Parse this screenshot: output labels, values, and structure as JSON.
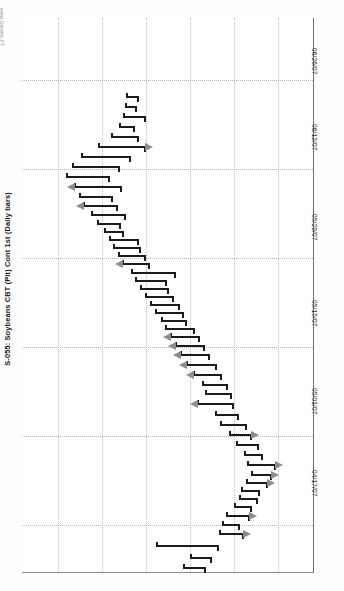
{
  "watermark": "www.Generic.FT",
  "title": "S-055: Soybeans CBT (Pit) Cont 1st (Daily bars)",
  "annotation": "16 h/l",
  "chart_data": {
    "type": "bar",
    "chart_style": "ohlc-daily-bars-rotated-90",
    "title": "S-055: Soybeans CBT (Pit) Cont 1st (Daily bars)",
    "xlabel": "Date",
    "ylabel": "Price (cents/bu)",
    "grid": true,
    "legend": null,
    "annotations": [
      "16 h/l"
    ],
    "axis_dates": [
      "06/26/07",
      "06/12/07",
      "05/29/07",
      "05/15/07",
      "05/01/07",
      "04/17/07"
    ],
    "date_tick_y": [
      52,
      128,
      218,
      302,
      392,
      472
    ],
    "price_gridlines_x": [
      36,
      80,
      124,
      168,
      212,
      256
    ],
    "date_gridlines_y": [
      62,
      151,
      240,
      329,
      418,
      507
    ],
    "ylim": [
      640,
      920
    ],
    "series": [
      {
        "name": "Soybeans CBT Pit Cont 1st",
        "ohlc": [
          {
            "date": "04/16/07",
            "low": 709,
            "high": 713,
            "open": 711,
            "close": 710,
            "arrow": null
          },
          {
            "date": "04/17/07",
            "low": 707,
            "high": 714,
            "open": 708,
            "close": 713,
            "arrow": null
          },
          {
            "date": "04/18/07",
            "low": 712,
            "high": 741,
            "open": 713,
            "close": 740,
            "arrow": null
          },
          {
            "date": "04/19/07",
            "low": 737,
            "high": 755,
            "open": 738,
            "close": 754,
            "arrow": "right"
          },
          {
            "date": "04/20/07",
            "low": 739,
            "high": 750,
            "open": 741,
            "close": 748,
            "arrow": null
          },
          {
            "date": "04/23/07",
            "low": 745,
            "high": 759,
            "open": 747,
            "close": 757,
            "arrow": "right"
          },
          {
            "date": "04/24/07",
            "low": 751,
            "high": 761,
            "open": 753,
            "close": 760,
            "arrow": null
          },
          {
            "date": "04/25/07",
            "low": 754,
            "high": 765,
            "open": 756,
            "close": 763,
            "arrow": null
          },
          {
            "date": "04/26/07",
            "low": 757,
            "high": 766,
            "open": 758,
            "close": 765,
            "arrow": null
          },
          {
            "date": "04/27/07",
            "low": 761,
            "high": 773,
            "open": 763,
            "close": 771,
            "arrow": "right"
          },
          {
            "date": "04/30/07",
            "low": 765,
            "high": 776,
            "open": 767,
            "close": 774,
            "arrow": "right"
          },
          {
            "date": "05/01/07",
            "low": 762,
            "high": 779,
            "open": 764,
            "close": 777,
            "arrow": "right"
          },
          {
            "date": "05/02/07",
            "low": 760,
            "high": 769,
            "open": 762,
            "close": 767,
            "arrow": null
          },
          {
            "date": "05/03/07",
            "low": 755,
            "high": 766,
            "open": 757,
            "close": 764,
            "arrow": null
          },
          {
            "date": "05/04/07",
            "low": 750,
            "high": 761,
            "open": 752,
            "close": 759,
            "arrow": "right"
          },
          {
            "date": "05/07/07",
            "low": 744,
            "high": 757,
            "open": 746,
            "close": 755,
            "arrow": null
          },
          {
            "date": "05/08/07",
            "low": 741,
            "high": 752,
            "open": 743,
            "close": 750,
            "arrow": null
          },
          {
            "date": "05/09/07",
            "low": 730,
            "high": 748,
            "open": 732,
            "close": 746,
            "arrow": "left"
          },
          {
            "date": "05/10/07",
            "low": 735,
            "high": 747,
            "open": 737,
            "close": 745,
            "arrow": null
          },
          {
            "date": "05/11/07",
            "low": 733,
            "high": 744,
            "open": 735,
            "close": 742,
            "arrow": null
          },
          {
            "date": "05/14/07",
            "low": 728,
            "high": 740,
            "open": 730,
            "close": 738,
            "arrow": "left"
          },
          {
            "date": "05/15/07",
            "low": 724,
            "high": 737,
            "open": 726,
            "close": 735,
            "arrow": "left"
          },
          {
            "date": "05/16/07",
            "low": 720,
            "high": 733,
            "open": 722,
            "close": 731,
            "arrow": "left"
          },
          {
            "date": "05/17/07",
            "low": 718,
            "high": 730,
            "open": 720,
            "close": 728,
            "arrow": "left"
          },
          {
            "date": "05/18/07",
            "low": 715,
            "high": 727,
            "open": 717,
            "close": 725,
            "arrow": "left"
          },
          {
            "date": "05/21/07",
            "low": 712,
            "high": 724,
            "open": 714,
            "close": 722,
            "arrow": null
          },
          {
            "date": "05/22/07",
            "low": 710,
            "high": 720,
            "open": 712,
            "close": 718,
            "arrow": null
          },
          {
            "date": "05/23/07",
            "low": 706,
            "high": 718,
            "open": 708,
            "close": 716,
            "arrow": null
          },
          {
            "date": "05/24/07",
            "low": 703,
            "high": 716,
            "open": 705,
            "close": 714,
            "arrow": null
          },
          {
            "date": "05/25/07",
            "low": 700,
            "high": 712,
            "open": 702,
            "close": 710,
            "arrow": null
          },
          {
            "date": "05/29/07",
            "low": 697,
            "high": 710,
            "open": 699,
            "close": 708,
            "arrow": null
          },
          {
            "date": "05/30/07",
            "low": 694,
            "high": 709,
            "open": 696,
            "close": 707,
            "arrow": null
          },
          {
            "date": "05/31/07",
            "low": 692,
            "high": 714,
            "open": 694,
            "close": 712,
            "arrow": null
          },
          {
            "date": "06/01/07",
            "low": 688,
            "high": 701,
            "open": 690,
            "close": 699,
            "arrow": "left"
          },
          {
            "date": "06/04/07",
            "low": 686,
            "high": 699,
            "open": 688,
            "close": 697,
            "arrow": null
          },
          {
            "date": "06/05/07",
            "low": 683,
            "high": 696,
            "open": 685,
            "close": 694,
            "arrow": null
          },
          {
            "date": "06/06/07",
            "low": 681,
            "high": 695,
            "open": 683,
            "close": 693,
            "arrow": null
          },
          {
            "date": "06/07/07",
            "low": 678,
            "high": 689,
            "open": 680,
            "close": 687,
            "arrow": null
          },
          {
            "date": "06/08/07",
            "low": 674,
            "high": 687,
            "open": 676,
            "close": 685,
            "arrow": null
          },
          {
            "date": "06/11/07",
            "low": 670,
            "high": 689,
            "open": 672,
            "close": 687,
            "arrow": null
          },
          {
            "date": "06/12/07",
            "low": 666,
            "high": 684,
            "open": 668,
            "close": 682,
            "arrow": "left"
          },
          {
            "date": "06/13/07",
            "low": 663,
            "high": 681,
            "open": 665,
            "close": 679,
            "arrow": null
          },
          {
            "date": "06/14/07",
            "low": 660,
            "high": 686,
            "open": 662,
            "close": 684,
            "arrow": "left"
          },
          {
            "date": "06/15/07",
            "low": 656,
            "high": 679,
            "open": 658,
            "close": 677,
            "arrow": null
          },
          {
            "date": "06/18/07",
            "low": 659,
            "high": 684,
            "open": 661,
            "close": 682,
            "arrow": null
          },
          {
            "date": "06/19/07",
            "low": 664,
            "high": 690,
            "open": 666,
            "close": 688,
            "arrow": null
          },
          {
            "date": "06/20/07",
            "low": 673,
            "high": 698,
            "open": 675,
            "close": 696,
            "arrow": "right"
          },
          {
            "date": "06/21/07",
            "low": 680,
            "high": 694,
            "open": 682,
            "close": 692,
            "arrow": null
          },
          {
            "date": "06/22/07",
            "low": 684,
            "high": 692,
            "open": 686,
            "close": 690,
            "arrow": null
          },
          {
            "date": "06/25/07",
            "low": 686,
            "high": 698,
            "open": 688,
            "close": 696,
            "arrow": null
          },
          {
            "date": "06/26/07",
            "low": 687,
            "high": 693,
            "open": 689,
            "close": 691,
            "arrow": null
          },
          {
            "date": "06/27/07",
            "low": 688,
            "high": 694,
            "open": 690,
            "close": 692,
            "arrow": null
          }
        ]
      }
    ]
  },
  "bars_px": [
    {
      "y": 567,
      "x1": 183,
      "x2": 206,
      "o": 1,
      "c": 0,
      "arrow": null
    },
    {
      "y": 557,
      "x1": 190,
      "x2": 212,
      "o": 0,
      "c": 1,
      "arrow": null
    },
    {
      "y": 545,
      "x1": 156,
      "x2": 219,
      "o": 0,
      "c": 1,
      "arrow": null
    },
    {
      "y": 533,
      "x1": 219,
      "x2": 244,
      "o": 0,
      "c": 1,
      "arrow": "right"
    },
    {
      "y": 524,
      "x1": 222,
      "x2": 240,
      "o": 0,
      "c": 1,
      "arrow": null
    },
    {
      "y": 515,
      "x1": 226,
      "x2": 250,
      "o": 0,
      "c": 1,
      "arrow": "right"
    },
    {
      "y": 506,
      "x1": 234,
      "x2": 252,
      "o": 0,
      "c": 1,
      "arrow": null
    },
    {
      "y": 498,
      "x1": 239,
      "x2": 258,
      "o": 0,
      "c": 1,
      "arrow": null
    },
    {
      "y": 490,
      "x1": 241,
      "x2": 260,
      "o": 0,
      "c": 1,
      "arrow": null
    },
    {
      "y": 482,
      "x1": 246,
      "x2": 268,
      "o": 0,
      "c": 1,
      "arrow": "right"
    },
    {
      "y": 474,
      "x1": 251,
      "x2": 272,
      "o": 0,
      "c": 1,
      "arrow": "right"
    },
    {
      "y": 464,
      "x1": 247,
      "x2": 276,
      "o": 0,
      "c": 1,
      "arrow": "right"
    },
    {
      "y": 454,
      "x1": 244,
      "x2": 263,
      "o": 0,
      "c": 1,
      "arrow": null
    },
    {
      "y": 444,
      "x1": 236,
      "x2": 259,
      "o": 0,
      "c": 1,
      "arrow": null
    },
    {
      "y": 434,
      "x1": 229,
      "x2": 252,
      "o": 0,
      "c": 1,
      "arrow": "right"
    },
    {
      "y": 424,
      "x1": 220,
      "x2": 247,
      "o": 0,
      "c": 1,
      "arrow": null
    },
    {
      "y": 414,
      "x1": 215,
      "x2": 239,
      "o": 0,
      "c": 1,
      "arrow": null
    },
    {
      "y": 403,
      "x1": 197,
      "x2": 234,
      "o": 0,
      "c": 1,
      "arrow": "left"
    },
    {
      "y": 393,
      "x1": 205,
      "x2": 232,
      "o": 0,
      "c": 1,
      "arrow": null
    },
    {
      "y": 384,
      "x1": 202,
      "x2": 228,
      "o": 0,
      "c": 1,
      "arrow": null
    },
    {
      "y": 374,
      "x1": 193,
      "x2": 222,
      "o": 0,
      "c": 1,
      "arrow": "left"
    },
    {
      "y": 364,
      "x1": 186,
      "x2": 217,
      "o": 0,
      "c": 1,
      "arrow": "left"
    },
    {
      "y": 354,
      "x1": 180,
      "x2": 210,
      "o": 0,
      "c": 1,
      "arrow": "left"
    },
    {
      "y": 345,
      "x1": 175,
      "x2": 205,
      "o": 0,
      "c": 1,
      "arrow": "left"
    },
    {
      "y": 336,
      "x1": 170,
      "x2": 200,
      "o": 0,
      "c": 1,
      "arrow": "left"
    },
    {
      "y": 328,
      "x1": 165,
      "x2": 195,
      "o": 0,
      "c": 1,
      "arrow": null
    },
    {
      "y": 320,
      "x1": 161,
      "x2": 187,
      "o": 0,
      "c": 1,
      "arrow": null
    },
    {
      "y": 312,
      "x1": 155,
      "x2": 184,
      "o": 0,
      "c": 1,
      "arrow": null
    },
    {
      "y": 304,
      "x1": 150,
      "x2": 180,
      "o": 0,
      "c": 1,
      "arrow": null
    },
    {
      "y": 296,
      "x1": 145,
      "x2": 174,
      "o": 0,
      "c": 1,
      "arrow": null
    },
    {
      "y": 288,
      "x1": 140,
      "x2": 169,
      "o": 0,
      "c": 1,
      "arrow": null
    },
    {
      "y": 280,
      "x1": 135,
      "x2": 167,
      "o": 0,
      "c": 1,
      "arrow": null
    },
    {
      "y": 272,
      "x1": 131,
      "x2": 176,
      "o": 0,
      "c": 1,
      "arrow": null
    },
    {
      "y": 263,
      "x1": 122,
      "x2": 150,
      "o": 0,
      "c": 1,
      "arrow": "left"
    },
    {
      "y": 255,
      "x1": 118,
      "x2": 146,
      "o": 0,
      "c": 1,
      "arrow": null
    },
    {
      "y": 247,
      "x1": 113,
      "x2": 141,
      "o": 0,
      "c": 1,
      "arrow": null
    },
    {
      "y": 239,
      "x1": 109,
      "x2": 139,
      "o": 0,
      "c": 1,
      "arrow": null
    },
    {
      "y": 231,
      "x1": 104,
      "x2": 124,
      "o": 0,
      "c": 1,
      "arrow": null
    },
    {
      "y": 223,
      "x1": 97,
      "x2": 121,
      "o": 0,
      "c": 1,
      "arrow": null
    },
    {
      "y": 214,
      "x1": 91,
      "x2": 126,
      "o": 0,
      "c": 1,
      "arrow": null
    },
    {
      "y": 205,
      "x1": 83,
      "x2": 118,
      "o": 0,
      "c": 1,
      "arrow": "left"
    },
    {
      "y": 196,
      "x1": 79,
      "x2": 113,
      "o": 0,
      "c": 1,
      "arrow": null
    },
    {
      "y": 186,
      "x1": 74,
      "x2": 122,
      "o": 0,
      "c": 1,
      "arrow": "left"
    },
    {
      "y": 176,
      "x1": 66,
      "x2": 110,
      "o": 0,
      "c": 1,
      "arrow": null
    },
    {
      "y": 166,
      "x1": 72,
      "x2": 120,
      "o": 0,
      "c": 1,
      "arrow": null
    },
    {
      "y": 156,
      "x1": 81,
      "x2": 131,
      "o": 0,
      "c": 1,
      "arrow": null
    },
    {
      "y": 146,
      "x1": 98,
      "x2": 146,
      "o": 0,
      "c": 1,
      "arrow": "right"
    },
    {
      "y": 136,
      "x1": 111,
      "x2": 139,
      "o": 0,
      "c": 1,
      "arrow": null
    },
    {
      "y": 126,
      "x1": 119,
      "x2": 135,
      "o": 0,
      "c": 1,
      "arrow": null
    },
    {
      "y": 116,
      "x1": 123,
      "x2": 146,
      "o": 0,
      "c": 1,
      "arrow": null
    },
    {
      "y": 106,
      "x1": 125,
      "x2": 137,
      "o": 0,
      "c": 1,
      "arrow": null
    },
    {
      "y": 96,
      "x1": 126,
      "x2": 139,
      "o": 0,
      "c": 1,
      "arrow": null
    }
  ],
  "grid": {
    "vertical_x": [
      36,
      80,
      124,
      168,
      212,
      256
    ],
    "horizontal_y": [
      62,
      151,
      240,
      329,
      418,
      507
    ]
  },
  "date_axis": {
    "labels": [
      {
        "text": "06/26/07",
        "y": 48
      },
      {
        "text": "06/12/07",
        "y": 124
      },
      {
        "text": "05/29/07",
        "y": 214
      },
      {
        "text": "05/15/07",
        "y": 300
      },
      {
        "text": "05/01/07",
        "y": 388
      },
      {
        "text": "04/17/07",
        "y": 470
      }
    ]
  }
}
